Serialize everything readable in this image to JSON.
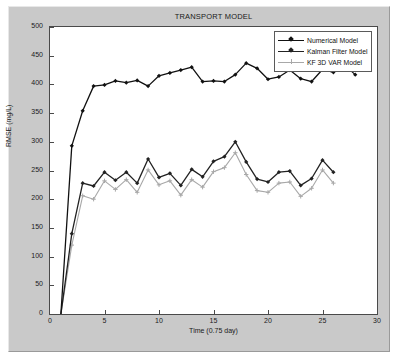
{
  "figure": {
    "background_color": "#c9c9c9",
    "plot_background_color": "#ffffff",
    "axis_color": "#4a4a4a"
  },
  "chart_data": {
    "type": "line",
    "title": "TRANSPORT MODEL",
    "xlabel": "Time (0.75 day)",
    "ylabel": "RMSE (mg/L)",
    "xlim": [
      0,
      30
    ],
    "ylim": [
      0,
      500
    ],
    "xticks": [
      0,
      5,
      10,
      15,
      20,
      25,
      30
    ],
    "xtick_labels": [
      "0",
      "5",
      "10",
      "15",
      "20",
      "25",
      "30"
    ],
    "yticks": [
      0,
      50,
      100,
      150,
      200,
      250,
      300,
      350,
      400,
      450,
      500
    ],
    "ytick_labels": [
      "0",
      "50",
      "100",
      "150",
      "200",
      "250",
      "300",
      "350",
      "400",
      "450",
      "500"
    ],
    "grid": false,
    "legend_position": "top-right",
    "x": [
      1,
      2,
      3,
      4,
      5,
      6,
      7,
      8,
      9,
      10,
      11,
      12,
      13,
      14,
      15,
      16,
      17,
      18,
      19,
      20,
      21,
      22,
      23,
      24,
      25,
      26,
      27,
      28,
      29,
      30
    ],
    "series": [
      {
        "name": "Numerical Model",
        "color": "#111111",
        "marker": "diamond",
        "values": [
          0,
          293,
          354,
          397,
          399,
          406,
          403,
          407,
          397,
          415,
          420,
          425,
          430,
          405,
          406,
          405,
          417,
          437,
          428,
          409,
          413,
          425,
          410,
          405,
          426,
          421,
          434,
          417,
          0,
          0
        ]
      },
      {
        "name": "Kalman Filter Model",
        "color": "#222222",
        "marker": "diamond",
        "values": [
          0,
          140,
          228,
          223,
          247,
          233,
          247,
          228,
          270,
          238,
          245,
          224,
          252,
          239,
          266,
          274,
          300,
          265,
          235,
          230,
          247,
          249,
          224,
          236,
          268,
          247,
          0,
          0,
          0,
          0
        ]
      },
      {
        "name": "KF 3D VAR Model",
        "color": "#a8a8a8",
        "marker": "plus",
        "values": [
          0,
          120,
          206,
          200,
          232,
          217,
          234,
          212,
          251,
          225,
          232,
          207,
          234,
          221,
          248,
          255,
          281,
          243,
          215,
          212,
          228,
          230,
          205,
          219,
          251,
          228,
          0,
          0,
          0,
          0
        ]
      }
    ],
    "series_points": [
      {
        "name": "Numerical Model",
        "points": [
          [
            1,
            0
          ],
          [
            2,
            293
          ],
          [
            3,
            354
          ],
          [
            4,
            397
          ],
          [
            5,
            399
          ],
          [
            6,
            406
          ],
          [
            7,
            403
          ],
          [
            8,
            407
          ],
          [
            9,
            397
          ],
          [
            10,
            415
          ],
          [
            11,
            420
          ],
          [
            12,
            425
          ],
          [
            13,
            430
          ],
          [
            14,
            405
          ],
          [
            15,
            406
          ],
          [
            16,
            405
          ],
          [
            17,
            417
          ],
          [
            18,
            437
          ],
          [
            19,
            428
          ],
          [
            20,
            409
          ],
          [
            21,
            413
          ],
          [
            22,
            425
          ],
          [
            23,
            410
          ],
          [
            24,
            405
          ],
          [
            25,
            426
          ],
          [
            26,
            421
          ],
          [
            27,
            434
          ],
          [
            28,
            417
          ]
        ]
      },
      {
        "name": "Kalman Filter Model",
        "points": [
          [
            1,
            0
          ],
          [
            2,
            140
          ],
          [
            3,
            228
          ],
          [
            4,
            223
          ],
          [
            5,
            247
          ],
          [
            6,
            233
          ],
          [
            7,
            247
          ],
          [
            8,
            228
          ],
          [
            9,
            270
          ],
          [
            10,
            238
          ],
          [
            11,
            245
          ],
          [
            12,
            224
          ],
          [
            13,
            252
          ],
          [
            14,
            239
          ],
          [
            15,
            266
          ],
          [
            16,
            274
          ],
          [
            17,
            300
          ],
          [
            18,
            265
          ],
          [
            19,
            235
          ],
          [
            20,
            230
          ],
          [
            21,
            247
          ],
          [
            22,
            249
          ],
          [
            23,
            224
          ],
          [
            24,
            236
          ],
          [
            25,
            268
          ],
          [
            26,
            247
          ]
        ]
      },
      {
        "name": "KF 3D VAR Model",
        "points": [
          [
            1,
            0
          ],
          [
            2,
            120
          ],
          [
            3,
            206
          ],
          [
            4,
            200
          ],
          [
            5,
            232
          ],
          [
            6,
            217
          ],
          [
            7,
            234
          ],
          [
            8,
            212
          ],
          [
            9,
            251
          ],
          [
            10,
            225
          ],
          [
            11,
            232
          ],
          [
            12,
            207
          ],
          [
            13,
            234
          ],
          [
            14,
            221
          ],
          [
            15,
            248
          ],
          [
            16,
            255
          ],
          [
            17,
            281
          ],
          [
            18,
            243
          ],
          [
            19,
            215
          ],
          [
            20,
            212
          ],
          [
            21,
            228
          ],
          [
            22,
            230
          ],
          [
            23,
            205
          ],
          [
            24,
            219
          ],
          [
            25,
            251
          ],
          [
            26,
            228
          ]
        ]
      }
    ]
  }
}
